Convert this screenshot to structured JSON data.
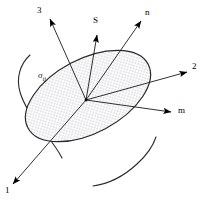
{
  "figure": {
    "background_color": "#ffffff",
    "line_color": "#1a1a1a",
    "fill_color": "#ffffff",
    "stipple_color": "#9a9aa6",
    "width": 210,
    "height": 201
  },
  "plane": {
    "name": "oblique-cut-plane",
    "tensor_label": "σ",
    "tensor_subscript": "ij",
    "tensor_label_x": 38,
    "tensor_label_y": 71,
    "fill": "stipple-dots",
    "center_x": 88,
    "center_y": 96,
    "radius_x": 68,
    "radius_y": 37,
    "rotation_deg": -28
  },
  "origin": {
    "name": "vector-origin-point",
    "x": 86,
    "y": 100
  },
  "vectors": [
    {
      "id": "axis-3",
      "label": "3",
      "kind": "principal-axis",
      "x1": 86,
      "y1": 100,
      "x2": 50,
      "y2": 19,
      "label_x": 37,
      "label_y": 6
    },
    {
      "id": "stress-S",
      "label": "S",
      "kind": "stress-vector",
      "x1": 86,
      "y1": 100,
      "x2": 97,
      "y2": 35,
      "label_x": 93,
      "label_y": 16
    },
    {
      "id": "normal-n",
      "label": "n",
      "kind": "unit-normal",
      "x1": 86,
      "y1": 100,
      "x2": 141,
      "y2": 21,
      "label_x": 145,
      "label_y": 8
    },
    {
      "id": "axis-2",
      "label": "2",
      "kind": "principal-axis",
      "x1": 86,
      "y1": 100,
      "x2": 187,
      "y2": 72,
      "label_x": 192,
      "label_y": 62
    },
    {
      "id": "tangent-m",
      "label": "m",
      "kind": "in-plane-direction",
      "x1": 86,
      "y1": 100,
      "x2": 171,
      "y2": 112,
      "label_x": 178,
      "label_y": 106
    },
    {
      "id": "axis-1",
      "label": "1",
      "kind": "principal-axis",
      "x1": 86,
      "y1": 100,
      "x2": 13,
      "y2": 184,
      "label_x": 5,
      "label_y": 186
    }
  ],
  "body_outlines": [
    {
      "name": "body-outline-left",
      "path": "M 30 55 C 20 64 16 78 20 92 C 24 106 34 120 45 133 C 52 142 58 150 62 158"
    },
    {
      "name": "body-outline-bottom",
      "path": "M 93 186 C 108 184 124 176 137 164 C 147 155 153 146 156 137"
    }
  ]
}
